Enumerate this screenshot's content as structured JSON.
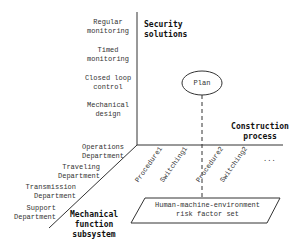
{
  "diagram": {
    "axes": {
      "vertical": {
        "title": "Security\nsolutions",
        "items": [
          "Regular\nmonitoring",
          "Timed\nmonitoring",
          "Closed loop\ncontrol",
          "Mechanical\ndesign"
        ]
      },
      "horizontal": {
        "title": "Construction\nprocess",
        "items": [
          "Procedure1",
          "Switching1",
          "Procedure2",
          "Switching2",
          "..."
        ]
      },
      "diagonal": {
        "title": "Mechanical\nfunction\nsubsystem",
        "items": [
          "Operations\nDepartment",
          "Traveling\nDepartment",
          "Transmission\nDepartment",
          "Support\nDepartment"
        ]
      }
    },
    "plan_node": "Plan",
    "risk_set": "Human-machine-environment\nrisk factor set",
    "colors": {
      "line": "#333333",
      "text": "#222222",
      "background": "#ffffff"
    }
  }
}
